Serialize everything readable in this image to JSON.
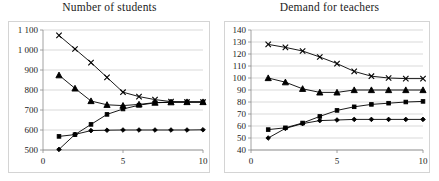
{
  "charts": [
    {
      "id": "number-of-students",
      "title": "Number of students"
    },
    {
      "id": "demand-for-teachers",
      "title": "Demand for teachers"
    }
  ],
  "chart_data": [
    {
      "type": "line",
      "title": "Number of students",
      "xlabel": "",
      "ylabel": "",
      "x": [
        1,
        2,
        3,
        4,
        5,
        6,
        7,
        8,
        9,
        10
      ],
      "xlim": [
        0,
        10
      ],
      "xticks": [
        0,
        5,
        10
      ],
      "xticklabels": [
        "0",
        "5",
        "10"
      ],
      "ylim": [
        500,
        1100
      ],
      "yticks": [
        500,
        600,
        700,
        800,
        900,
        1000,
        1100
      ],
      "yticklabels": [
        "500",
        "600",
        "700",
        "800",
        "900",
        "1 000",
        "1 100"
      ],
      "grid": true,
      "legend": "none",
      "series": [
        {
          "name": "series-cross",
          "marker": "cross",
          "values": [
            1073,
            1005,
            937,
            863,
            789,
            767,
            752,
            742,
            740,
            740
          ]
        },
        {
          "name": "series-triangle",
          "marker": "triangle",
          "values": [
            874,
            808,
            745,
            726,
            722,
            728,
            737,
            739,
            740,
            740
          ]
        },
        {
          "name": "series-square",
          "marker": "square",
          "values": [
            568,
            577,
            628,
            678,
            705,
            724,
            736,
            739,
            740,
            740
          ]
        },
        {
          "name": "series-diamond",
          "marker": "diamond",
          "values": [
            503,
            578,
            597,
            599,
            600,
            600,
            600,
            600,
            600,
            601
          ]
        }
      ]
    },
    {
      "type": "line",
      "title": "Demand for teachers",
      "xlabel": "",
      "ylabel": "",
      "x": [
        1,
        2,
        3,
        4,
        5,
        6,
        7,
        8,
        9,
        10
      ],
      "xlim": [
        0,
        10
      ],
      "xticks": [
        0,
        5,
        10
      ],
      "xticklabels": [
        "0",
        "5",
        "10"
      ],
      "ylim": [
        40,
        140
      ],
      "yticks": [
        40,
        50,
        60,
        70,
        80,
        90,
        100,
        110,
        120,
        130,
        140
      ],
      "yticklabels": [
        "40",
        "50",
        "60",
        "70",
        "80",
        "90",
        "100",
        "110",
        "120",
        "130",
        "140"
      ],
      "grid": true,
      "legend": "none",
      "series": [
        {
          "name": "series-cross",
          "marker": "cross",
          "values": [
            128,
            125.5,
            122.5,
            117.5,
            112,
            105.5,
            101.5,
            100,
            99.5,
            99.5
          ]
        },
        {
          "name": "series-triangle",
          "marker": "triangle",
          "values": [
            100,
            96.5,
            91,
            88,
            88,
            90,
            90,
            90,
            90,
            90
          ]
        },
        {
          "name": "series-square",
          "marker": "square",
          "values": [
            57,
            58.5,
            62.5,
            68,
            73,
            76,
            78,
            79,
            80,
            80.5
          ]
        },
        {
          "name": "series-diamond",
          "marker": "diamond",
          "values": [
            50,
            58,
            62,
            64.5,
            65,
            65.5,
            65.5,
            65.5,
            65.5,
            65.5
          ]
        }
      ]
    }
  ]
}
